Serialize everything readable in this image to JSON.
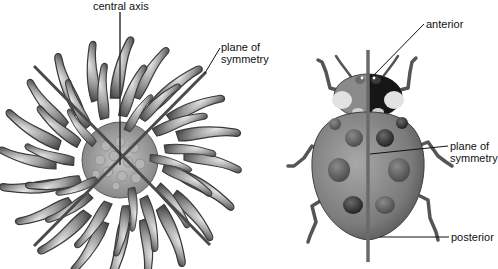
{
  "figure": {
    "left_panel": {
      "subject": "radially symmetric organism",
      "labels": {
        "central_axis": "central axis",
        "plane_of_symmetry": "plane of\nsymmetry"
      }
    },
    "right_panel": {
      "subject": "bilaterally symmetric ladybug",
      "labels": {
        "anterior": "anterior",
        "plane_of_symmetry": "plane of\nsymmetry",
        "posterior": "posterior"
      }
    }
  },
  "colors": {
    "background": "#ffffff",
    "axis_line": "#555555",
    "leader_line": "#111111",
    "tentacle": "#8a8a8a",
    "body": "#7a7a7a",
    "spot": "#2a2a2a"
  }
}
